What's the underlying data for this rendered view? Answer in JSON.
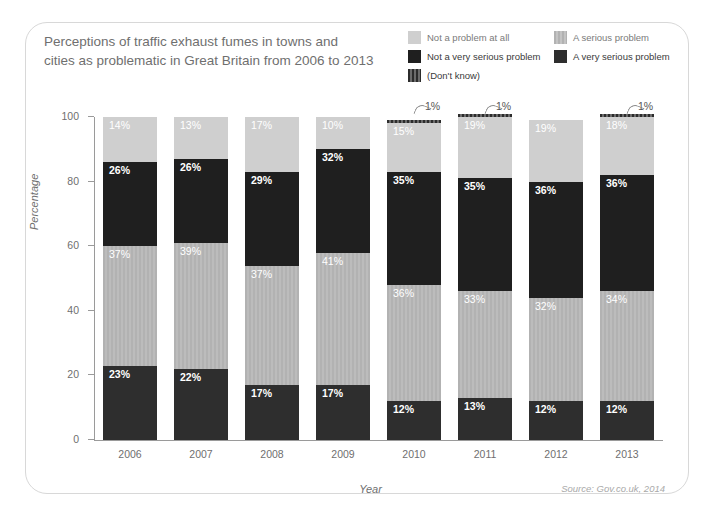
{
  "card": {
    "title_line1": "Perceptions of traffic exhaust fumes in towns and",
    "title_line2": "cities as problematic in Great Britain from 2006 to 2013",
    "source": "Source: Gov.co.uk, 2014"
  },
  "legend": {
    "items": [
      {
        "label": "Not a problem at all",
        "color": "#cfcfcf",
        "style": "solid",
        "muted": true
      },
      {
        "label": "A serious problem",
        "color": "#b2b2b2",
        "style": "striped-light",
        "muted": true
      },
      {
        "label": "Not a very serious problem",
        "color": "#1f1f1f",
        "style": "solid",
        "muted": false
      },
      {
        "label": "A very serious problem",
        "color": "#2e2e2e",
        "style": "solid",
        "muted": false
      },
      {
        "label": "(Don't know)",
        "color": "#3a3a3a",
        "style": "striped",
        "muted": false
      }
    ]
  },
  "chart_data": {
    "type": "bar",
    "subtype": "stacked-100",
    "title": "Perceptions of traffic exhaust fumes in towns and cities as problematic in Great Britain from 2006 to 2013",
    "xlabel": "Year",
    "ylabel": "Percentage",
    "ylim": [
      0,
      100
    ],
    "yticks": [
      0,
      20,
      40,
      60,
      80,
      100
    ],
    "grid": false,
    "legend_position": "top-right",
    "categories": [
      "2006",
      "2007",
      "2008",
      "2009",
      "2010",
      "2011",
      "2012",
      "2013"
    ],
    "stack_order_bottom_to_top": [
      "A very serious problem",
      "A serious problem",
      "Not a very serious problem",
      "Not a problem at all",
      "(Don't know)"
    ],
    "series": [
      {
        "name": "A very serious problem",
        "color": "#2e2e2e",
        "values": [
          23,
          22,
          17,
          17,
          12,
          13,
          12,
          12
        ]
      },
      {
        "name": "A serious problem",
        "color": "#b2b2b2",
        "values": [
          37,
          39,
          37,
          41,
          36,
          33,
          32,
          34
        ]
      },
      {
        "name": "Not a very serious problem",
        "color": "#1f1f1f",
        "values": [
          26,
          26,
          29,
          32,
          35,
          35,
          36,
          36
        ]
      },
      {
        "name": "Not a problem at all",
        "color": "#cfcfcf",
        "values": [
          14,
          13,
          17,
          10,
          15,
          19,
          19,
          18
        ]
      },
      {
        "name": "(Don't know)",
        "color": "#3a3a3a",
        "values": [
          0,
          0,
          0,
          0,
          1,
          1,
          0,
          1
        ]
      }
    ],
    "labels": {
      "2006": [
        "23%",
        "37%",
        "26%",
        "14%"
      ],
      "2007": [
        "22%",
        "39%",
        "26%",
        "13%"
      ],
      "2008": [
        "17%",
        "37%",
        "29%",
        "17%"
      ],
      "2009": [
        "17%",
        "41%",
        "32%",
        "10%"
      ],
      "2010": [
        "12%",
        "36%",
        "35%",
        "15%",
        "1%"
      ],
      "2011": [
        "13%",
        "33%",
        "35%",
        "19%",
        "1%"
      ],
      "2012": [
        "12%",
        "32%",
        "36%",
        "19%"
      ],
      "2013": [
        "12%",
        "34%",
        "36%",
        "18%",
        "1%"
      ]
    },
    "callouts": [
      {
        "category": "2010",
        "text": "1%"
      },
      {
        "category": "2011",
        "text": "1%"
      },
      {
        "category": "2013",
        "text": "1%"
      }
    ]
  }
}
